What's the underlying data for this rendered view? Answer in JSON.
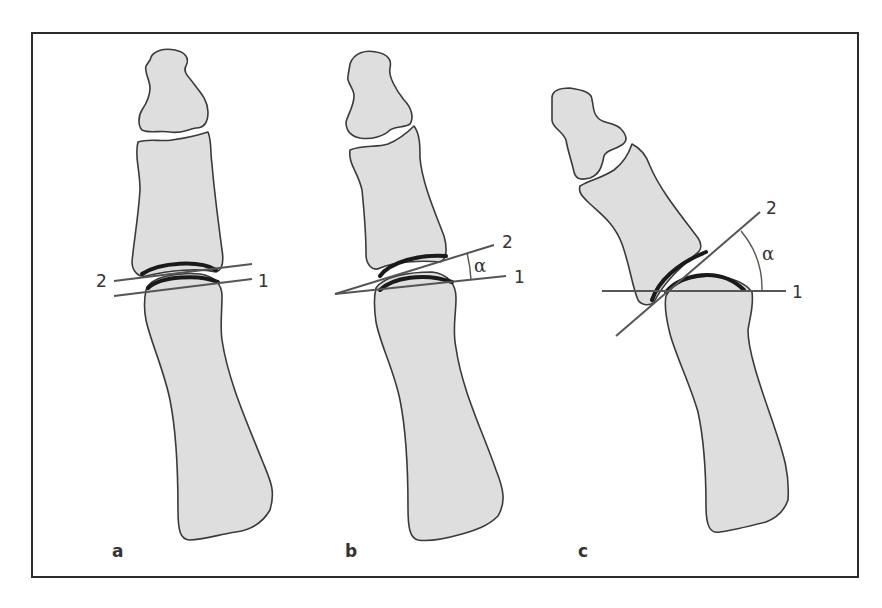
{
  "figure": {
    "panels": [
      {
        "id": "a",
        "label": "a",
        "line1_label": "1",
        "line2_label": "2",
        "angle_label": ""
      },
      {
        "id": "b",
        "label": "b",
        "line1_label": "1",
        "line2_label": "2",
        "angle_label": "α"
      },
      {
        "id": "c",
        "label": "c",
        "line1_label": "1",
        "line2_label": "2",
        "angle_label": "α"
      }
    ],
    "colors": {
      "bone_fill": "#dedede",
      "outline": "#3a3a3a",
      "cartilage": "#1a1a1a",
      "axis_line": "#555555",
      "frame": "#2b2b2b"
    }
  }
}
